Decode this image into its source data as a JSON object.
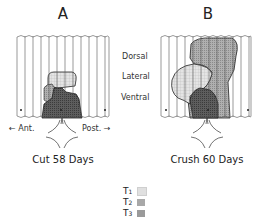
{
  "figure": {
    "panels": [
      {
        "label": "A",
        "caption": "Cut 58 Days"
      },
      {
        "label": "B",
        "caption": "Crush 60 Days"
      }
    ],
    "region_labels": [
      "Dorsal",
      "Lateral",
      "Ventral"
    ],
    "direction_labels": {
      "anterior": "← Ant.",
      "posterior": "Post. →"
    },
    "legend": [
      {
        "label": "T",
        "sub": "1",
        "color": "#d9d9d9",
        "pattern": "light-grid"
      },
      {
        "label": "T",
        "sub": "2",
        "color": "#a8a8a8",
        "pattern": "medium-dots"
      },
      {
        "label": "T",
        "sub": "3",
        "color": "#6a6a6a",
        "pattern": "dark-dots"
      }
    ]
  }
}
